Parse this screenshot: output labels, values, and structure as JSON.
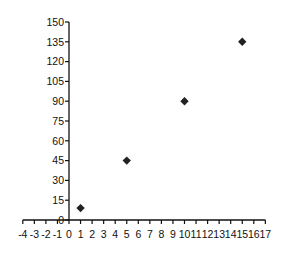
{
  "chart_data": {
    "type": "scatter",
    "title": "",
    "xlabel": "",
    "ylabel": "",
    "x": [
      1,
      5,
      10,
      15
    ],
    "y": [
      9,
      45,
      90,
      135
    ],
    "series": [
      {
        "name": "",
        "marker": "diamond",
        "color": "#222222",
        "x": [
          1,
          5,
          10,
          15
        ],
        "y": [
          9,
          45,
          90,
          135
        ]
      }
    ],
    "xlim": [
      -4,
      17
    ],
    "ylim": [
      0,
      150
    ],
    "x_ticks": [
      -4,
      -3,
      -2,
      -1,
      0,
      1,
      2,
      3,
      4,
      5,
      6,
      7,
      8,
      9,
      10,
      11,
      12,
      13,
      14,
      15,
      16,
      17
    ],
    "y_ticks": [
      0,
      15,
      30,
      45,
      60,
      75,
      90,
      105,
      120,
      135,
      150
    ],
    "grid": false,
    "legend": null
  }
}
